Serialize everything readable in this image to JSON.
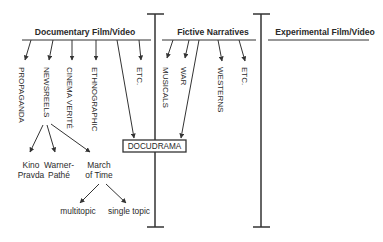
{
  "diagram": {
    "columns": [
      {
        "title": "Documentary Film/Video"
      },
      {
        "title": "Fictive Narratives"
      },
      {
        "title": "Experimental Film/Video"
      }
    ],
    "documentary_branches": [
      {
        "label": "PROPAGANDA"
      },
      {
        "label": "NEWSREELS"
      },
      {
        "label": "CINEMA VERITÉ"
      },
      {
        "label": "ETHNOGRAPHIC"
      },
      {
        "label": "ETC."
      }
    ],
    "fictive_branches": [
      {
        "label": "MUSICALS"
      },
      {
        "label": "WAR"
      },
      {
        "label": "WESTERNS"
      },
      {
        "label": "ETC."
      }
    ],
    "newsreel_children": [
      {
        "line1": "Kino",
        "line2": "Pravda"
      },
      {
        "line1": "Warner-",
        "line2": "Pathé"
      },
      {
        "line1": "March",
        "line2": "of Time"
      }
    ],
    "march_of_time_children": [
      {
        "label": "multitopic"
      },
      {
        "label": "single topic"
      }
    ],
    "hybrid": {
      "label": "DOCUDRAMA"
    },
    "colors": {
      "ink": "#2a2a2a",
      "line": "#333333",
      "background": "#ffffff"
    }
  }
}
